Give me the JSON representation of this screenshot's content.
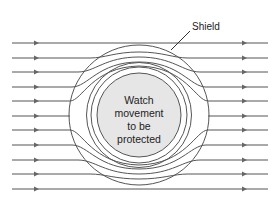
{
  "diagram": {
    "labels": {
      "shield": "Shield",
      "core_line1": "Watch",
      "core_line2": "movement",
      "core_line3": "to be",
      "core_line4": "protected"
    },
    "colors": {
      "line": "#555555",
      "core_fill": "#e6e6e6",
      "background": "#ffffff"
    },
    "field_line_count": 11
  }
}
